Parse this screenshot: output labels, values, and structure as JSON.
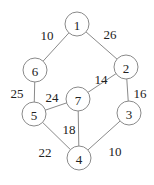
{
  "nodes": [
    {
      "id": "1",
      "x": 77,
      "y": 24
    },
    {
      "id": "2",
      "x": 126,
      "y": 67
    },
    {
      "id": "3",
      "x": 129,
      "y": 113
    },
    {
      "id": "4",
      "x": 79,
      "y": 158
    },
    {
      "id": "5",
      "x": 34,
      "y": 114
    },
    {
      "id": "6",
      "x": 35,
      "y": 70
    },
    {
      "id": "7",
      "x": 78,
      "y": 99
    }
  ],
  "edges": [
    {
      "from": "1",
      "to": "6",
      "weight": "10",
      "lx": 47,
      "ly": 35
    },
    {
      "from": "1",
      "to": "2",
      "weight": "26",
      "lx": 110,
      "ly": 34
    },
    {
      "from": "6",
      "to": "5",
      "weight": "25",
      "lx": 17,
      "ly": 93
    },
    {
      "from": "2",
      "to": "7",
      "weight": "14",
      "lx": 101,
      "ly": 79
    },
    {
      "from": "2",
      "to": "3",
      "weight": "16",
      "lx": 140,
      "ly": 93
    },
    {
      "from": "5",
      "to": "7",
      "weight": "24",
      "lx": 52,
      "ly": 97
    },
    {
      "from": "7",
      "to": "4",
      "weight": "18",
      "lx": 69,
      "ly": 129
    },
    {
      "from": "5",
      "to": "4",
      "weight": "22",
      "lx": 45,
      "ly": 152
    },
    {
      "from": "3",
      "to": "4",
      "weight": "10",
      "lx": 115,
      "ly": 151
    }
  ],
  "node_radius": 12
}
